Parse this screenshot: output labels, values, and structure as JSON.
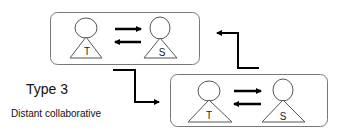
{
  "diagram": {
    "title": "Type 3",
    "subtitle": "Distant collaborative",
    "groups": [
      {
        "id": "top",
        "nodes": [
          {
            "id": "T",
            "label": "T"
          },
          {
            "id": "S",
            "label": "S"
          }
        ],
        "edges": [
          {
            "from": "T",
            "to": "S"
          },
          {
            "from": "S",
            "to": "T"
          }
        ]
      },
      {
        "id": "bottom",
        "nodes": [
          {
            "id": "T",
            "label": "T"
          },
          {
            "id": "S",
            "label": "S"
          }
        ],
        "edges": [
          {
            "from": "T",
            "to": "S"
          },
          {
            "from": "S",
            "to": "T"
          }
        ]
      }
    ],
    "connectors": [
      {
        "from": "top",
        "to": "bottom"
      },
      {
        "from": "bottom",
        "to": "top"
      }
    ],
    "colors": {
      "box_stroke": "#777777",
      "shape_stroke": "#555555",
      "arrow": "#000000",
      "text": "#111111"
    }
  }
}
